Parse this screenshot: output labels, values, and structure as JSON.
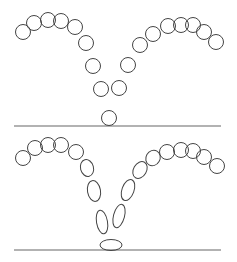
{
  "diagram": {
    "stroke_color": "#444444",
    "background": "#ffffff",
    "panels": [
      {
        "name": "rigid-ball",
        "floor": {
          "x1": 14,
          "x2": 221,
          "y": 126
        },
        "balls": [
          {
            "cx": 23,
            "cy": 32,
            "rx": 7.5,
            "ry": 7.5,
            "rot": 0
          },
          {
            "cx": 34,
            "cy": 23,
            "rx": 7.5,
            "ry": 7.5,
            "rot": 0
          },
          {
            "cx": 48,
            "cy": 20,
            "rx": 7.5,
            "ry": 7.5,
            "rot": 0
          },
          {
            "cx": 61,
            "cy": 21,
            "rx": 7.5,
            "ry": 7.5,
            "rot": 0
          },
          {
            "cx": 75,
            "cy": 27,
            "rx": 7.5,
            "ry": 7.5,
            "rot": 0
          },
          {
            "cx": 86,
            "cy": 43,
            "rx": 7.5,
            "ry": 7.5,
            "rot": 0
          },
          {
            "cx": 93,
            "cy": 66,
            "rx": 7.5,
            "ry": 7.5,
            "rot": 0
          },
          {
            "cx": 101,
            "cy": 89,
            "rx": 7.5,
            "ry": 7.5,
            "rot": 0
          },
          {
            "cx": 109,
            "cy": 118,
            "rx": 7.5,
            "ry": 7.5,
            "rot": 0
          },
          {
            "cx": 119,
            "cy": 88,
            "rx": 7.5,
            "ry": 7.5,
            "rot": 0
          },
          {
            "cx": 128,
            "cy": 65,
            "rx": 7.5,
            "ry": 7.5,
            "rot": 0
          },
          {
            "cx": 140,
            "cy": 45,
            "rx": 7.5,
            "ry": 7.5,
            "rot": 0
          },
          {
            "cx": 153,
            "cy": 34,
            "rx": 7.5,
            "ry": 7.5,
            "rot": 0
          },
          {
            "cx": 168,
            "cy": 26,
            "rx": 7.5,
            "ry": 7.5,
            "rot": 0
          },
          {
            "cx": 181,
            "cy": 25,
            "rx": 7.5,
            "ry": 7.5,
            "rot": 0
          },
          {
            "cx": 193,
            "cy": 25,
            "rx": 7.5,
            "ry": 7.5,
            "rot": 0
          },
          {
            "cx": 204,
            "cy": 32,
            "rx": 7.5,
            "ry": 7.5,
            "rot": 0
          },
          {
            "cx": 216,
            "cy": 42,
            "rx": 7.5,
            "ry": 7.5,
            "rot": 0
          }
        ]
      },
      {
        "name": "squash-stretch-ball",
        "floor": {
          "x1": 14,
          "x2": 221,
          "y": 250
        },
        "balls": [
          {
            "cx": 23,
            "cy": 158,
            "rx": 7.5,
            "ry": 7.5,
            "rot": 0
          },
          {
            "cx": 35,
            "cy": 148,
            "rx": 7.5,
            "ry": 7.5,
            "rot": 0
          },
          {
            "cx": 48,
            "cy": 145,
            "rx": 7.5,
            "ry": 7.5,
            "rot": 0
          },
          {
            "cx": 61,
            "cy": 145,
            "rx": 7.5,
            "ry": 7.5,
            "rot": 0
          },
          {
            "cx": 76,
            "cy": 152,
            "rx": 7.5,
            "ry": 7.5,
            "rot": 0
          },
          {
            "cx": 87,
            "cy": 168,
            "rx": 6.5,
            "ry": 8.5,
            "rot": -15
          },
          {
            "cx": 94,
            "cy": 191,
            "rx": 6.5,
            "ry": 10.5,
            "rot": -10
          },
          {
            "cx": 102,
            "cy": 222,
            "rx": 5.5,
            "ry": 12,
            "rot": -10
          },
          {
            "cx": 111,
            "cy": 245,
            "rx": 11,
            "ry": 5.5,
            "rot": 0
          },
          {
            "cx": 119,
            "cy": 216,
            "rx": 5.5,
            "ry": 12,
            "rot": 15
          },
          {
            "cx": 128,
            "cy": 190,
            "rx": 6,
            "ry": 11,
            "rot": 20
          },
          {
            "cx": 140,
            "cy": 170,
            "rx": 6.5,
            "ry": 9,
            "rot": 30
          },
          {
            "cx": 153,
            "cy": 158,
            "rx": 7,
            "ry": 8,
            "rot": 30
          },
          {
            "cx": 167,
            "cy": 152,
            "rx": 7.5,
            "ry": 7.5,
            "rot": 0
          },
          {
            "cx": 181,
            "cy": 150,
            "rx": 7.5,
            "ry": 7.5,
            "rot": 0
          },
          {
            "cx": 193,
            "cy": 151,
            "rx": 7.5,
            "ry": 7.5,
            "rot": 0
          },
          {
            "cx": 204,
            "cy": 157,
            "rx": 7.5,
            "ry": 7.5,
            "rot": 0
          },
          {
            "cx": 217,
            "cy": 166,
            "rx": 7.5,
            "ry": 7.5,
            "rot": 0
          }
        ]
      }
    ]
  }
}
